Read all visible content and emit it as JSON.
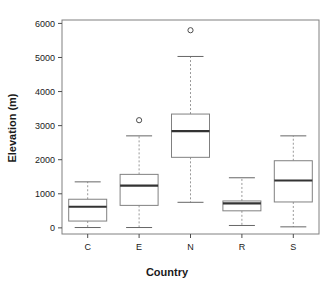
{
  "chart_data": {
    "type": "box",
    "title": "",
    "xlabel": "Country",
    "ylabel": "Elevation (m)",
    "categories": [
      "C",
      "E",
      "N",
      "R",
      "S"
    ],
    "ytick_labels": [
      "0",
      "1000",
      "2000",
      "3000",
      "4000",
      "5000",
      "6000"
    ],
    "ytick_values": [
      0,
      1000,
      2000,
      3000,
      4000,
      5000,
      6000
    ],
    "ylim": [
      -180,
      6100
    ],
    "xlim": [
      0.5,
      5.5
    ],
    "grid": false,
    "legend": null,
    "boxes": [
      {
        "category": "C",
        "whisker_low": 10,
        "q1": 200,
        "median": 620,
        "q3": 840,
        "whisker_high": 1350,
        "outliers": []
      },
      {
        "category": "E",
        "whisker_low": 10,
        "q1": 660,
        "median": 1240,
        "q3": 1570,
        "whisker_high": 2700,
        "outliers": [
          3160
        ]
      },
      {
        "category": "N",
        "whisker_low": 750,
        "q1": 2070,
        "median": 2840,
        "q3": 3340,
        "whisker_high": 5030,
        "outliers": [
          5800
        ]
      },
      {
        "category": "R",
        "whisker_low": 70,
        "q1": 500,
        "median": 720,
        "q3": 790,
        "whisker_high": 1470,
        "outliers": []
      },
      {
        "category": "S",
        "whisker_low": 30,
        "q1": 760,
        "median": 1390,
        "q3": 1970,
        "whisker_high": 2700,
        "outliers": []
      }
    ],
    "colors": {
      "box_fill": "#ffffff",
      "box_stroke": "#808080",
      "median": "#333333",
      "whisker": "#999999",
      "text": "#1a1a1a",
      "background": "#ffffff"
    }
  }
}
